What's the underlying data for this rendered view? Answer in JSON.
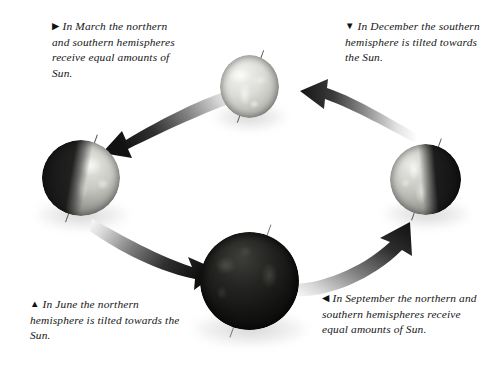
{
  "diagram": {
    "background_color": "#ffffff"
  },
  "captions": {
    "march": {
      "marker": "▶",
      "marker_name": "triangle-right-marker",
      "text": "In March the northern and southern hemispheres receive equal amounts of Sun."
    },
    "december": {
      "marker": "▼",
      "marker_name": "triangle-down-marker",
      "text": "In December the southern hemisphere is tilted towards the Sun."
    },
    "june": {
      "marker": "▲",
      "marker_name": "triangle-up-marker",
      "text": "In June the northern hemisphere is tilted towards the Sun."
    },
    "september": {
      "marker": "◀",
      "marker_name": "triangle-left-marker",
      "text": "In September the northern and southern hemispheres receive equal amounts of Sun."
    }
  },
  "globes": [
    {
      "id": "march",
      "label": "March",
      "position": "top",
      "illumination": "fully lit, light grey",
      "axis_tilt_degrees": 20,
      "diameter_px": 59
    },
    {
      "id": "june",
      "label": "June",
      "position": "left",
      "illumination": "dark left half, lit right half",
      "axis_tilt_degrees": 20,
      "diameter_px": 78
    },
    {
      "id": "december",
      "label": "December",
      "position": "right",
      "illumination": "lit left half, dark right half",
      "axis_tilt_degrees": 20,
      "diameter_px": 71
    },
    {
      "id": "september",
      "label": "September",
      "position": "bottom",
      "illumination": "mostly dark / night side",
      "axis_tilt_degrees": 20,
      "diameter_px": 99
    }
  ],
  "arrows": [
    {
      "id": "march-to-june",
      "direction": "left",
      "from": "march",
      "to": "june"
    },
    {
      "id": "december-to-march",
      "direction": "left",
      "from": "december",
      "to": "march"
    },
    {
      "id": "june-to-september",
      "direction": "right",
      "from": "june",
      "to": "september"
    },
    {
      "id": "september-to-december",
      "direction": "right",
      "from": "september",
      "to": "december"
    }
  ],
  "colors": {
    "text": "#161616",
    "arrow_dark": "#1d1d1d",
    "arrow_light": "#e9e9e9",
    "axis_line": "#5a5a5a"
  }
}
